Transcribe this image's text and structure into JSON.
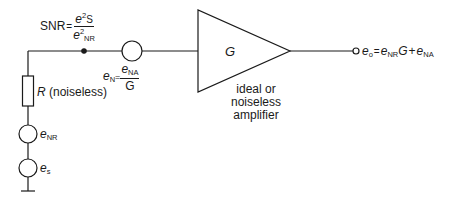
{
  "diagram": {
    "type": "circuit",
    "snr_label": {
      "lhs": "SNR",
      "eq": "=",
      "num_var": "e",
      "num_sup": "2",
      "num_sub": "S",
      "den_var": "e",
      "den_sup": "2",
      "den_sub": "NR"
    },
    "input_noise_label": {
      "var": "e",
      "sub": "N",
      "eq": "=",
      "num_var": "e",
      "num_sub": "NA",
      "den": "G"
    },
    "amplifier": {
      "gain_label": "G",
      "caption_lines": [
        "ideal or",
        "noiseless",
        "amplifier"
      ]
    },
    "output_label": {
      "var": "e",
      "sub": "o",
      "eq": "=",
      "t1_var": "e",
      "t1_sub": "NR",
      "t1_mult": "G",
      "plus": "+",
      "t2_var": "e",
      "t2_sub": "NA"
    },
    "resistor_label": {
      "var": "R",
      "note": "(noiseless)"
    },
    "source_nr_label": {
      "var": "e",
      "sub": "NR"
    },
    "source_s_label": {
      "var": "e",
      "sub": "s"
    }
  }
}
